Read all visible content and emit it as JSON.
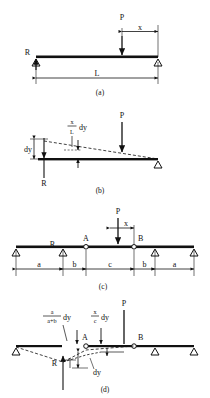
{
  "figure": {
    "background_color": "#ffffff",
    "line_color": "#111111",
    "panels": [
      {
        "id": "a",
        "caption": "(a)",
        "description": "Simply supported beam with concentrated load P",
        "labels": {
          "load": "P",
          "reaction": "R",
          "span": "L",
          "load_distance": "x"
        }
      },
      {
        "id": "b",
        "caption": "(b)",
        "description": "Virtual displacement diagram of the simple beam giving the influence ordinate",
        "labels": {
          "load": "P",
          "reaction": "R",
          "virtual_displacement": "dy",
          "ordinate_numerator": "x",
          "ordinate_denominator": "L",
          "ordinate_suffix": "dy"
        }
      },
      {
        "id": "c",
        "caption": "(c)",
        "description": "Continuous beam with internal hinges at A and B carrying load P",
        "labels": {
          "load": "P",
          "reaction": "R",
          "hinge_left": "A",
          "hinge_right": "B",
          "load_distance": "x"
        },
        "dimensions": [
          "a",
          "b",
          "c",
          "b",
          "a"
        ]
      },
      {
        "id": "d",
        "caption": "(d)",
        "description": "Virtual displacement diagram of the continuous beam giving the influence ordinate",
        "labels": {
          "load": "P",
          "reaction": "R",
          "hinge_left": "A",
          "hinge_right": "B",
          "virtual_displacement": "dy",
          "left_frac_numerator": "a",
          "left_frac_denominator": "a+b",
          "left_frac_suffix": "dy",
          "right_frac_numerator": "x",
          "right_frac_denominator": "c",
          "right_frac_suffix": "dy"
        }
      }
    ]
  }
}
